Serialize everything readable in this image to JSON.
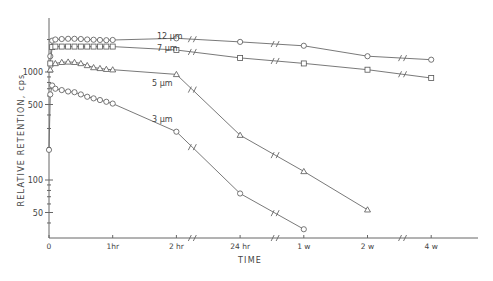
{
  "chart_data": {
    "type": "line",
    "title": "",
    "xlabel": "TIME",
    "ylabel": "RELATIVE RETENTION, cps",
    "yscale": "log",
    "ylim": [
      30,
      2500
    ],
    "grid": false,
    "legend": "inline labels",
    "x_ticks": [
      {
        "label": "0",
        "pos": 0
      },
      {
        "label": "1hr",
        "pos": 1
      },
      {
        "label": "2 hr",
        "pos": 2
      },
      {
        "label": "24 hr",
        "pos": 3
      },
      {
        "label": "1 w",
        "pos": 4
      },
      {
        "label": "2 w",
        "pos": 5
      },
      {
        "label": "4 w",
        "pos": 6
      }
    ],
    "y_ticks": [
      {
        "label": "1000",
        "value": 1000
      },
      {
        "label": "500",
        "value": 500
      },
      {
        "label": "100",
        "value": 100
      },
      {
        "label": "50",
        "value": 50
      }
    ],
    "axis_breaks_x": [
      2.25,
      3.55,
      5.55
    ],
    "series": [
      {
        "name": "12 µm",
        "label": "12 µm",
        "marker": "circle",
        "points": [
          [
            0.02,
            1400
          ],
          [
            0.05,
            1950
          ],
          [
            0.1,
            2000
          ],
          [
            0.2,
            2020
          ],
          [
            0.3,
            2030
          ],
          [
            0.4,
            2030
          ],
          [
            0.5,
            2020
          ],
          [
            0.6,
            2000
          ],
          [
            0.7,
            1990
          ],
          [
            0.8,
            1980
          ],
          [
            0.9,
            1970
          ],
          [
            1.0,
            1980
          ],
          [
            2.0,
            2050
          ],
          [
            3.0,
            1900
          ],
          [
            4.0,
            1750
          ],
          [
            5.0,
            1400
          ],
          [
            6.0,
            1300
          ]
        ]
      },
      {
        "name": "7 µm",
        "label": "7 µm",
        "marker": "square",
        "points": [
          [
            0.02,
            1200
          ],
          [
            0.05,
            1700
          ],
          [
            0.1,
            1720
          ],
          [
            0.2,
            1720
          ],
          [
            0.3,
            1720
          ],
          [
            0.4,
            1720
          ],
          [
            0.5,
            1720
          ],
          [
            0.6,
            1720
          ],
          [
            0.7,
            1720
          ],
          [
            0.8,
            1720
          ],
          [
            0.9,
            1720
          ],
          [
            1.0,
            1720
          ],
          [
            2.0,
            1600
          ],
          [
            3.0,
            1350
          ],
          [
            4.0,
            1200
          ],
          [
            5.0,
            1050
          ],
          [
            6.0,
            880
          ]
        ]
      },
      {
        "name": "5 µm",
        "label": "5 µm",
        "marker": "triangle",
        "points": [
          [
            0.02,
            1050
          ],
          [
            0.1,
            1200
          ],
          [
            0.2,
            1230
          ],
          [
            0.3,
            1240
          ],
          [
            0.4,
            1230
          ],
          [
            0.5,
            1200
          ],
          [
            0.6,
            1150
          ],
          [
            0.7,
            1100
          ],
          [
            0.8,
            1080
          ],
          [
            0.9,
            1060
          ],
          [
            1.0,
            1050
          ],
          [
            2.0,
            950
          ],
          [
            3.0,
            260
          ],
          [
            4.0,
            120
          ],
          [
            5.0,
            53
          ]
        ]
      },
      {
        "name": "3 µm",
        "label": "3 µm",
        "marker": "circle",
        "points": [
          [
            0.0,
            190
          ],
          [
            0.02,
            620
          ],
          [
            0.05,
            750
          ],
          [
            0.1,
            700
          ],
          [
            0.2,
            680
          ],
          [
            0.3,
            660
          ],
          [
            0.4,
            650
          ],
          [
            0.5,
            620
          ],
          [
            0.6,
            590
          ],
          [
            0.7,
            570
          ],
          [
            0.8,
            550
          ],
          [
            0.9,
            530
          ],
          [
            1.0,
            510
          ],
          [
            2.0,
            280
          ],
          [
            3.0,
            75
          ],
          [
            4.0,
            35
          ]
        ]
      }
    ]
  }
}
